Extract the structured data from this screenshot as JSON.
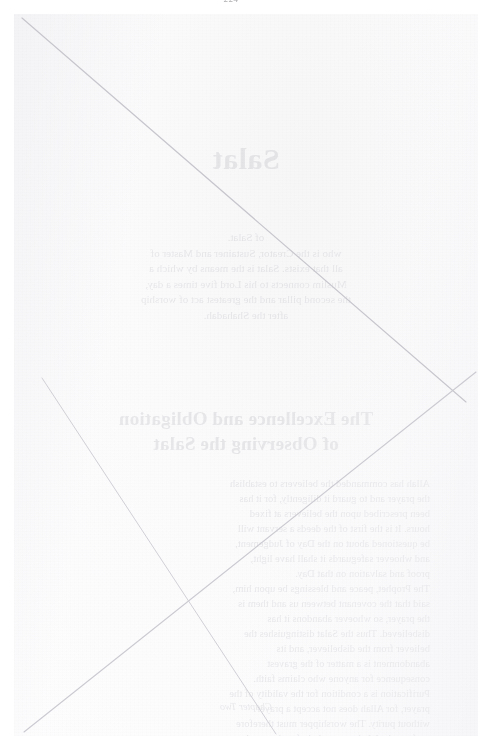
{
  "document": {
    "kind": "scanned-page",
    "page_number_mark": "224",
    "condition": "near-blank page; only reverse-side bleed-through visible",
    "paper_color": "#fbfbfc",
    "ink_color": "#b9b9c0",
    "stroke_color": "#c9c9d0"
  },
  "bleedthrough": {
    "note": "Text is show-through from the reverse side, therefore mirrored and extremely faint.",
    "title": "Salat",
    "intro": [
      "of Salat.",
      "who is the Creator, Sustainer and Master of",
      "all that exists. Salat is the means by which a",
      "Muslim connects to his Lord five times a day,",
      "the second pillar and the greatest act of worship",
      "after the Shahadah."
    ],
    "heading": [
      "The Excellence and Obligation",
      "of Observing the Salat"
    ],
    "body": [
      "Allah has commanded the believers to establish",
      "the prayer and to guard it diligently, for it has",
      "been prescribed upon the believers at fixed",
      "hours. It is the first of the deeds a servant will",
      "be questioned about on the Day of Judgement,",
      "and whoever safeguards it shall have light,",
      "proof and salvation on that Day.",
      "The Prophet, peace and blessings be upon him,",
      "said that the covenant between us and them is",
      "the prayer, so whoever abandons it has",
      "disbelieved. Thus the Salat distinguishes the",
      "believer from the disbeliever, and its",
      "abandonment is a matter of the gravest",
      "consequence for anyone who claims faith.",
      "Purification is a condition for the validity of the",
      "prayer, for Allah does not accept a prayer",
      "without purity. The worshipper must therefore",
      "perform the Wudu correctly before he stands",
      "before his Lord, facing the Qiblah with humility",
      "and presence of heart.",
      "Whoever prays the five daily prayers at their",
      "appointed times, completing their bowing and",
      "prostration, their humility and devotion, has a",
      "promise from Allah that He will forgive him."
    ],
    "caption": "Chapter Two"
  },
  "strokes": {
    "count": 3,
    "description": [
      "long diagonal from the upper-left corner to the lower-right edge",
      "diagonal rising from the lower-left corner to the right edge",
      "short diagonal from the middle-left down to the lower-middle"
    ]
  }
}
